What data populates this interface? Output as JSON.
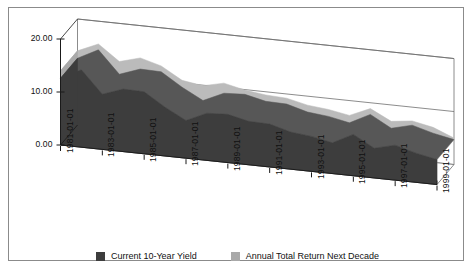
{
  "chart_data": {
    "type": "area",
    "title": "",
    "subtitle": "",
    "xlabel": "",
    "ylabel": "",
    "grid": true,
    "legend_position": "bottom",
    "ylim": [
      0.0,
      20.0
    ],
    "yticks": [
      "0.00",
      "10.00",
      "20.00"
    ],
    "ytick_values": [
      0.0,
      10.0,
      20.0
    ],
    "x": [
      "1981-01-01",
      "1982-01-01",
      "1983-01-01",
      "1984-01-01",
      "1985-01-01",
      "1986-01-01",
      "1987-01-01",
      "1988-01-01",
      "1989-01-01",
      "1990-01-01",
      "1991-01-01",
      "1992-01-01",
      "1993-01-01",
      "1994-01-01",
      "1995-01-01",
      "1996-01-01",
      "1997-01-01",
      "1998-01-01",
      "1999-01-01"
    ],
    "xtick_labels": [
      "1981-01-01",
      "1983-01-01",
      "1985-01-01",
      "1987-01-01",
      "1989-01-01",
      "1991-01-01",
      "1993-01-01",
      "1995-01-01",
      "1997-01-01",
      "1999-01-01"
    ],
    "xtick_indices": [
      0,
      2,
      4,
      6,
      8,
      10,
      12,
      14,
      16,
      18
    ],
    "series": [
      {
        "name": "Current 10-Year Yield",
        "color": "#3d3d3d",
        "values": [
          12.6,
          14.6,
          10.4,
          11.8,
          11.7,
          9.2,
          7.1,
          8.9,
          9.1,
          8.2,
          8.1,
          7.0,
          6.6,
          5.8,
          7.8,
          5.6,
          6.6,
          5.5,
          4.7
        ]
      },
      {
        "name": "Annual Total Return Next Decade",
        "color": "#a9a9a9",
        "values": [
          14.0,
          15.7,
          12.8,
          13.9,
          12.8,
          10.5,
          9.9,
          10.8,
          9.9,
          9.4,
          9.2,
          8.3,
          7.9,
          7.2,
          8.9,
          6.9,
          7.4,
          6.6,
          5.0
        ]
      }
    ]
  },
  "legend": {
    "items": [
      {
        "label": "Current 10-Year Yield",
        "color": "#3d3d3d"
      },
      {
        "label": "Annual Total Return Next Decade",
        "color": "#a9a9a9"
      }
    ]
  },
  "colors": {
    "series_dark": "#3d3d3d",
    "series_light": "#a9a9a9",
    "frame": "#8b8b8b",
    "axis": "#1a1a1a",
    "background": "#ffffff"
  }
}
